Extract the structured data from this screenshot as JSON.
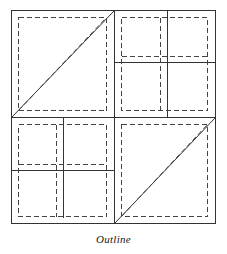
{
  "figure": {
    "caption": "Outline",
    "title": "Outline",
    "background_color": "#ffffff",
    "stroke_color": "#333333",
    "dashed_stroke_color": "#444444",
    "canvas": {
      "width": 227,
      "height": 254
    },
    "frame": {
      "x": 11,
      "y": 10,
      "width": 205,
      "height": 214
    },
    "midlines": {
      "vertical_x": 114,
      "horizontal_y": 117
    },
    "stroke_width": 1,
    "dash_pattern": "5 3",
    "quadrants": [
      {
        "name": "top-left",
        "content": "diagonal",
        "solid_rect": {
          "x": 11,
          "y": 10,
          "width": 103,
          "height": 107
        },
        "dashed_rect": {
          "x": 18,
          "y": 17,
          "width": 89,
          "height": 94
        },
        "solid_diagonal": {
          "x1": 11,
          "y1": 117,
          "x2": 114,
          "y2": 10
        },
        "dashed_diagonal": {
          "x1": 18,
          "y1": 111,
          "x2": 107,
          "y2": 17
        }
      },
      {
        "name": "top-right",
        "content": "grid-2x2",
        "solid_rect": {
          "x": 114,
          "y": 10,
          "width": 102,
          "height": 107
        },
        "dashed_rect": {
          "x": 121,
          "y": 17,
          "width": 87,
          "height": 94
        },
        "solid_divider_vertical_x": 167,
        "solid_divider_horizontal_y": 62,
        "dashed_divider_vertical_x": 160,
        "dashed_divider_horizontal_y": 56
      },
      {
        "name": "bottom-left",
        "content": "grid-2x2",
        "solid_rect": {
          "x": 11,
          "y": 117,
          "width": 103,
          "height": 107
        },
        "dashed_rect": {
          "x": 18,
          "y": 124,
          "width": 89,
          "height": 93
        },
        "solid_divider_vertical_x": 63,
        "solid_divider_horizontal_y": 170,
        "dashed_divider_vertical_x": 56,
        "dashed_divider_horizontal_y": 164
      },
      {
        "name": "bottom-right",
        "content": "diagonal",
        "solid_rect": {
          "x": 114,
          "y": 117,
          "width": 102,
          "height": 107
        },
        "dashed_rect": {
          "x": 121,
          "y": 124,
          "width": 87,
          "height": 93
        },
        "solid_diagonal": {
          "x1": 114,
          "y1": 224,
          "x2": 216,
          "y2": 117
        },
        "dashed_diagonal": {
          "x1": 121,
          "y1": 217,
          "x2": 208,
          "y2": 124
        }
      }
    ]
  }
}
